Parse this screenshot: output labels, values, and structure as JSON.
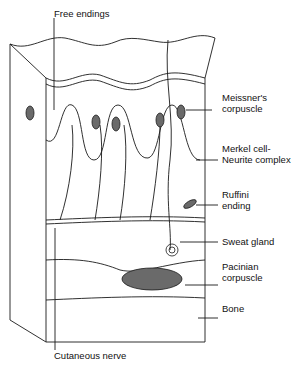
{
  "diagram": {
    "labels": {
      "free_endings": "Free endings",
      "meissner_1": "Meissner's",
      "meissner_2": "corpuscle",
      "merkel_1": "Merkel cell-",
      "merkel_2": "Neurite complex",
      "ruffini_1": "Ruffini",
      "ruffini_2": "ending",
      "sweat_gland": "Sweat gland",
      "pacinian_1": "Pacinian",
      "pacinian_2": "corpuscle",
      "bone": "Bone",
      "cutaneous_nerve": "Cutaneous nerve"
    },
    "colors": {
      "line": "#1a1a1a",
      "corpuscle_fill": "#6a6a6a",
      "background": "#ffffff"
    }
  }
}
